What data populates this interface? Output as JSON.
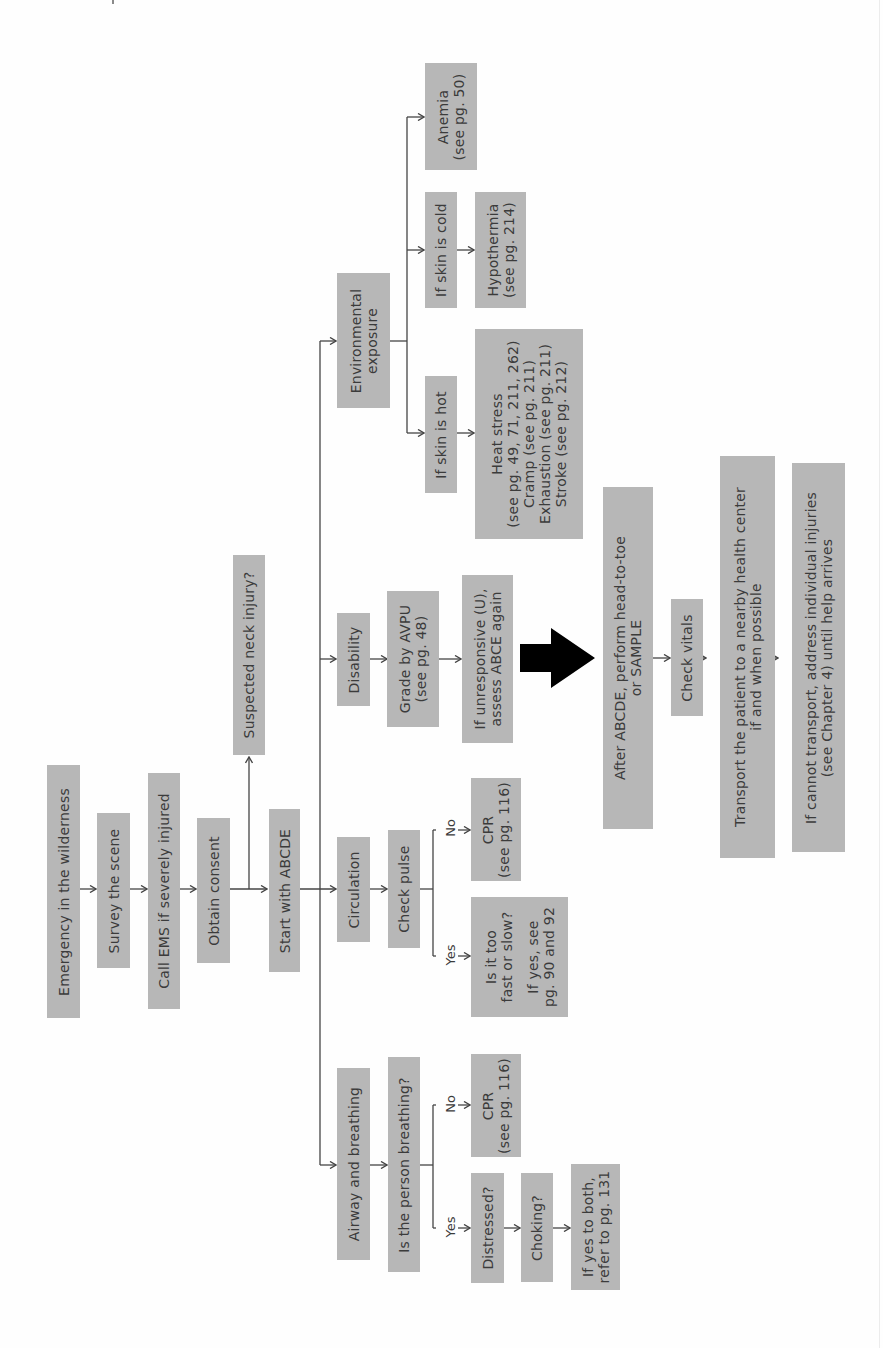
{
  "colors": {
    "box_fill": "#b7b7b7",
    "text": "#3b3b3b",
    "line": "#444444",
    "big_arrow": "#000000"
  },
  "orientation": "rotated 90 degrees counter-clockwise; text reads bottom-to-top",
  "flow": {
    "emergency": "Emergency in the wilderness",
    "survey": "Survey the scene",
    "call_ems": "Call EMS if severely injured",
    "consent": "Obtain consent",
    "neck": "Suspected neck injury?",
    "start": "Start with ABCDE"
  },
  "airway": {
    "title": "Airway and breathing",
    "question": "Is the person breathing?",
    "no_label": "No",
    "yes_label": "Yes",
    "cpr_line1": "CPR",
    "cpr_line2": "(see pg. 116)",
    "distressed": "Distressed?",
    "choking": "Choking?",
    "refer_line1": "If yes to both,",
    "refer_line2": "refer to pg. 131"
  },
  "circulation": {
    "title": "Circulation",
    "question": "Check pulse",
    "no_label": "No",
    "yes_label": "Yes",
    "cpr_line1": "CPR",
    "cpr_line2": "(see pg. 116)",
    "rate_line1": "Is it too",
    "rate_line2": "fast or slow?",
    "rate_line3": "",
    "rate_line4": "If yes, see",
    "rate_line5": "pg. 90 and 92"
  },
  "disability": {
    "title": "Disability",
    "grade_line1": "Grade by AVPU",
    "grade_line2": "(see pg. 48)",
    "unresp_line1": "If unresponsive (U),",
    "unresp_line2": "assess ABCE again"
  },
  "exposure": {
    "title_line1": "Environmental",
    "title_line2": "exposure",
    "hot": "If skin is hot",
    "heat_line1": "Heat stress",
    "heat_line2": "(see pg. 49, 71, 211, 262)",
    "heat_line3": "Cramp (see pg. 211)",
    "heat_line4": "Exhaustion (see pg. 211)",
    "heat_line5": "Stroke (see pg. 212)",
    "cold": "If skin is cold",
    "hypo_line1": "Hypothermia",
    "hypo_line2": "(see pg. 214)",
    "anemia_line1": "Anemia",
    "anemia_line2": "(see pg. 50)"
  },
  "after": {
    "secondary_line1": "After ABCDE, perform head-to-toe",
    "secondary_line2": "or SAMPLE",
    "vitals": "Check vitals",
    "transport_line1": "Transport the patient to a nearby health center",
    "transport_line2": "if and when possible",
    "cannot_line1": "If cannot transport, address individual injuries",
    "cannot_line2": "(see Chapter 4) until help arrives"
  }
}
